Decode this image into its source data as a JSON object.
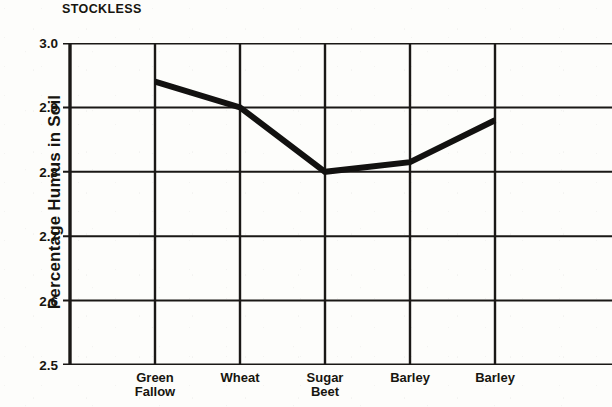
{
  "chart_data": {
    "type": "line",
    "title": "STOCKLESS",
    "xlabel": "",
    "ylabel": "Percentage Humus in Soil",
    "categories": [
      "Green Fallow",
      "Wheat",
      "Sugar Beet",
      "Barley",
      "Barley"
    ],
    "category_lines": [
      [
        "Green",
        "Fallow"
      ],
      [
        "Wheat"
      ],
      [
        "Sugar",
        "Beet"
      ],
      [
        "Barley"
      ],
      [
        "Barley"
      ]
    ],
    "values": [
      2.94,
      2.9,
      2.8,
      2.815,
      2.88
    ],
    "series": [
      {
        "name": "Percentage Humus in Soil",
        "values": [
          2.94,
          2.9,
          2.8,
          2.815,
          2.88
        ]
      }
    ],
    "ylim": [
      2.5,
      3.0
    ],
    "ytick_values": [
      3.0,
      2.9,
      2.8,
      2.7,
      2.6,
      2.5
    ],
    "ytick_labels": [
      "3.0",
      "2.9",
      "2.8",
      "2.7",
      "2.6",
      "2.5"
    ],
    "grid": true,
    "grid_horizontal": true,
    "grid_vertical": true,
    "legend": false,
    "legend_position": "none",
    "markers": false,
    "line_color": "#121110",
    "line_width_px": 6,
    "grid_color": "#1a1816",
    "axis_color": "#121110",
    "background_color": "#fdfdfb",
    "text_color": "#17150f"
  }
}
